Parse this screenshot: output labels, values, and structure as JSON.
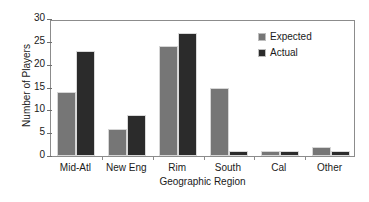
{
  "chart_data": {
    "type": "bar",
    "title": "",
    "xlabel": "Geographic Region",
    "ylabel": "Number of Players",
    "categories": [
      "Mid-Atl",
      "New Eng",
      "Rim",
      "South",
      "Cal",
      "Other"
    ],
    "series": [
      {
        "name": "Expected",
        "values": [
          14,
          6,
          24,
          15,
          1,
          2
        ],
        "color": "#767676"
      },
      {
        "name": "Actual",
        "values": [
          23,
          9,
          27,
          1,
          1,
          1
        ],
        "color": "#2b2b2b"
      }
    ],
    "ylim": [
      0,
      30
    ],
    "yticks": [
      0,
      5,
      10,
      15,
      20,
      25,
      30
    ],
    "ytick_labels": [
      "0",
      "5",
      "10",
      "15",
      "20",
      "25",
      "30"
    ],
    "grid": false,
    "legend_position": "top-right",
    "frame_color": "#8c8c8c"
  }
}
